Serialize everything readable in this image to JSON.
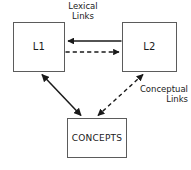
{
  "diagram": {
    "background_color": "#ffffff",
    "stroke_color": "#1a1a1a",
    "box_border_color": "#5b5b5b",
    "nodes": [
      {
        "id": "l1",
        "label": "L1",
        "x": 13,
        "y": 22,
        "width": 52,
        "height": 50
      },
      {
        "id": "l2",
        "label": "L2",
        "x": 122,
        "y": 22,
        "width": 55,
        "height": 50
      },
      {
        "id": "concepts",
        "label": "CONCEPTS",
        "x": 67,
        "y": 118,
        "width": 60,
        "height": 40
      }
    ],
    "labels": {
      "lexical": {
        "line1": "Lexical",
        "line2": "Links"
      },
      "conceptual": {
        "line1": "Conceptual",
        "line2": "Links"
      }
    },
    "edges": [
      {
        "id": "l2-to-l1",
        "from": "l2",
        "to": "l1",
        "style": "solid",
        "arrows": "single-head-left",
        "group": "lexical"
      },
      {
        "id": "l1-to-l2",
        "from": "l1",
        "to": "l2",
        "style": "dashed",
        "arrows": "single-head-right",
        "group": "lexical"
      },
      {
        "id": "l1-concepts",
        "from": "l1",
        "to": "concepts",
        "style": "solid",
        "arrows": "double-head",
        "group": "conceptual"
      },
      {
        "id": "l2-concepts",
        "from": "l2",
        "to": "concepts",
        "style": "dashed",
        "arrows": "double-head",
        "group": "conceptual"
      }
    ]
  }
}
